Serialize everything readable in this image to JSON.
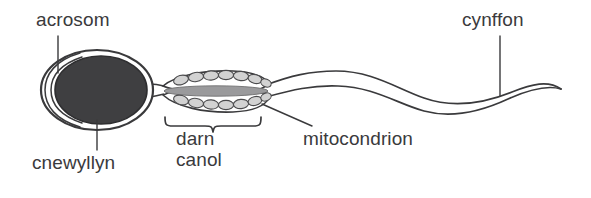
{
  "diagram": {
    "language": "cy",
    "background_color": "#ffffff",
    "stroke_color": "#3a3a3c",
    "nucleus_fill": "#3f3f41",
    "midpiece_fill": "#9a9a9c",
    "mitochondria_fill": "#c8c8c8",
    "text_color": "#3a3a3c"
  },
  "labels": {
    "acrosom": "acrosom",
    "cnewyllyn": "cnewyllyn",
    "darn_canol_line1": "darn",
    "darn_canol_line2": "canol",
    "mitocondrion": "mitocondrion",
    "cynffon": "cynffon"
  },
  "structures": [
    {
      "name": "acrosome",
      "label": "acrosom",
      "description": "layered cap at the anterior of the head"
    },
    {
      "name": "nucleus",
      "label": "cnewyllyn",
      "description": "dark filled ellipse forming the head"
    },
    {
      "name": "midpiece",
      "label": "darn canol",
      "description": "region marked by a curly brace below"
    },
    {
      "name": "mitochondrion",
      "label": "mitocondrion",
      "description": "chain of small ovals around the midpiece"
    },
    {
      "name": "tail",
      "label": "cynffon",
      "description": "long wavy flagellum tapering to a point"
    }
  ]
}
